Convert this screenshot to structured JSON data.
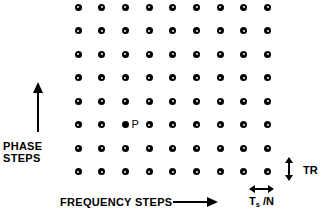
{
  "figure": {
    "name": "k-space-sampling-grid",
    "background_color": "#ffffff",
    "ink_color": "#000000"
  },
  "grid": {
    "columns": 9,
    "rows": 8,
    "origin_x": 78,
    "origin_y": 7,
    "step_x": 23.7,
    "step_y": 23.5,
    "dot_style": "ring",
    "highlight": {
      "label": "P",
      "row_index": 5,
      "col_index": 2,
      "style": "solid"
    }
  },
  "axes": {
    "vertical": {
      "label_lines": [
        "PHASE",
        "STEPS"
      ],
      "direction": "up"
    },
    "horizontal": {
      "label": "FREQUENCY STEPS",
      "direction": "right"
    }
  },
  "annotations": {
    "vertical_interval": {
      "label": "TR",
      "orientation": "vertical"
    },
    "horizontal_interval": {
      "label_main": "T",
      "label_sub": "s",
      "label_tail": " /N",
      "orientation": "horizontal"
    }
  }
}
